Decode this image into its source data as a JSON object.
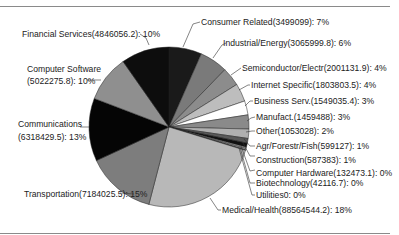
{
  "chart_data": {
    "type": "pie",
    "title": "",
    "legend": "none (leader-line labels)",
    "slices": [
      {
        "label": "Consumer Related",
        "value": 3499099,
        "percent": 7,
        "text": "Consumer Related(3499099): 7%",
        "color": "#1a1a1a"
      },
      {
        "label": "Industrial/Energy",
        "value": 3065999.8,
        "percent": 6,
        "text": "Industrial/Energy(3065999.8): 6%",
        "color": "#7a7a7a"
      },
      {
        "label": "Semiconductor/Electr",
        "value": 2001131.9,
        "percent": 4,
        "text": "Semiconductor/Electr(2001131.9): 4%",
        "color": "#8c8c8c"
      },
      {
        "label": "Internet Specific",
        "value": 1803803.5,
        "percent": 4,
        "text": "Internet Specific(1803803.5): 4%",
        "color": "#bdbdbd"
      },
      {
        "label": "Business Serv.",
        "value": 1549035.4,
        "percent": 3,
        "text": "Business Serv.(1549035.4): 3%",
        "color": "#ffffff"
      },
      {
        "label": "Manufact.",
        "value": 1459488,
        "percent": 3,
        "text": "Manufact.(1459488): 3%",
        "color": "#8a8a8a"
      },
      {
        "label": "Other",
        "value": 1053028,
        "percent": 2,
        "text": "Other(1053028): 2%",
        "color": "#b0b0b0"
      },
      {
        "label": "Agr/Forestr/Fish",
        "value": 599127,
        "percent": 1,
        "text": "Agr/Forestr/Fish(599127): 1%",
        "color": "#5a5a5a"
      },
      {
        "label": "Construction",
        "value": 587383,
        "percent": 1,
        "text": "Construction(587383): 1%",
        "color": "#111111"
      },
      {
        "label": "Computer Hardware",
        "value": 132473.1,
        "percent": 0,
        "text": "Computer Hardware(132473.1): 0%",
        "color": "#9a9a9a"
      },
      {
        "label": "Biotechnology",
        "value": 42116.7,
        "percent": 0,
        "text": "Biotechnology(42116.7): 0%",
        "color": "#dddddd"
      },
      {
        "label": "Utilities",
        "value": 0,
        "percent": 0,
        "text": "Utilities0: 0%",
        "color": "#666666"
      },
      {
        "label": "Medical/Health",
        "value": 88564544.2,
        "percent": 18,
        "text": "Medical/Health(88564544.2): 18%",
        "color": "#b8b8b8"
      },
      {
        "label": "Transportation",
        "value": 7184025.5,
        "percent": 15,
        "text": "Transportation(7184025.5): 15%",
        "color": "#7d7d7d"
      },
      {
        "label": "Communications",
        "value": 6318429.5,
        "percent": 13,
        "text": "Communications (6318429.5): 13%",
        "color": "#050505"
      },
      {
        "label": "Computer Software",
        "value": 5022275.8,
        "percent": 10,
        "text": "Computer Software (5022275.8): 10%",
        "color": "#8f8f8f"
      },
      {
        "label": "Financial Services",
        "value": 4846056.2,
        "percent": 10,
        "text": "Financial Services(4846056.2): 10%",
        "color": "#0d0d0d"
      }
    ]
  },
  "labels": {
    "consumer": "Consumer Related(3499099): 7%",
    "industrial": "Industrial/Energy(3065999.8): 6%",
    "semi": "Semiconductor/Electr(2001131.9): 4%",
    "internet": "Internet Specific(1803803.5): 4%",
    "business": "Business Serv.(1549035.4): 3%",
    "manufact": "Manufact.(1459488): 3%",
    "other": "Other(1053028): 2%",
    "agr": "Agr/Forestr/Fish(599127): 1%",
    "construction": "Construction(587383): 1%",
    "hardware": "Computer Hardware(132473.1): 0%",
    "biotech": "Biotechnology(42116.7): 0%",
    "utilities": "Utilities0: 0%",
    "medical": "Medical/Health(88564544.2): 18%",
    "transportation": "Transportation(7184025.5): 15%",
    "communications_1": "Communications",
    "communications_2": "(6318429.5): 13%",
    "software_1": "Computer Software",
    "software_2": "(5022275.8): 10%",
    "financial": "Financial Services(4846056.2): 10%"
  }
}
